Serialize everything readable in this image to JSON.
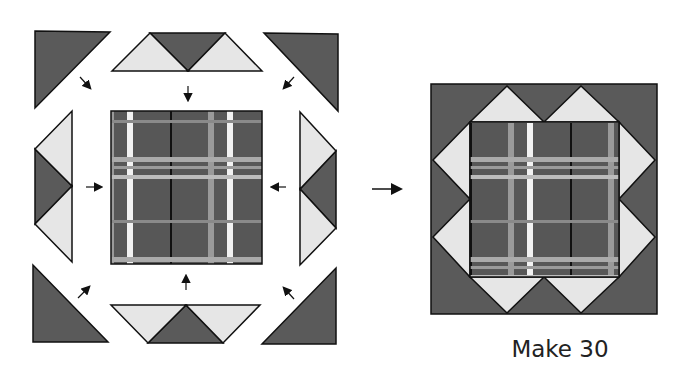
{
  "diagram": {
    "type": "quilt block assembly",
    "colors": {
      "dark": "#5a5a5a",
      "light": "#e6e6e6",
      "plaid_base": "#575757",
      "plaid_light_stripe": "#9a9a9a",
      "plaid_white_stripe": "#f2f2f2",
      "outline": "#111111"
    },
    "left_group": {
      "label": "unsewn pieces",
      "pieces": [
        "corner triangle TL",
        "flying geese top",
        "corner triangle TR",
        "flying geese left",
        "plaid center square",
        "flying geese right",
        "corner triangle BL",
        "flying geese bottom",
        "corner triangle BR"
      ]
    },
    "arrow_between": "right-arrow",
    "right_group": {
      "label": "finished block"
    },
    "caption": "Make 30"
  }
}
